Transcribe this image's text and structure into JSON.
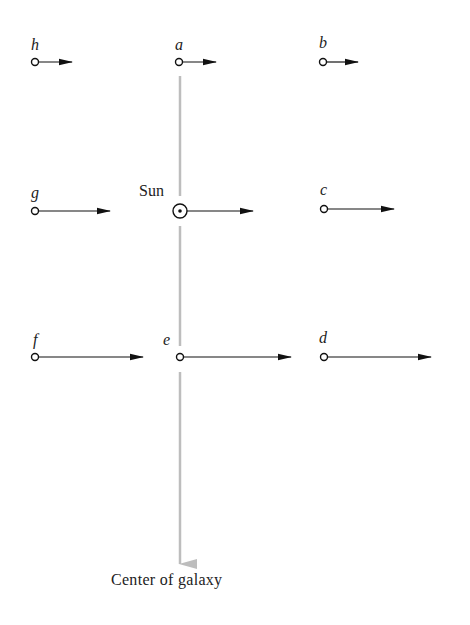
{
  "diagram": {
    "sun_label": "Sun",
    "center_label": "Center of galaxy",
    "colors": {
      "ink": "#111111",
      "axis": "#bdbdbd",
      "background": "#ffffff"
    },
    "stars": [
      {
        "id": "h",
        "label": "h",
        "x": 35,
        "y": 62,
        "arrow_end": 72
      },
      {
        "id": "a",
        "label": "a",
        "x": 179,
        "y": 62,
        "arrow_end": 216
      },
      {
        "id": "b",
        "label": "b",
        "x": 323,
        "y": 62,
        "arrow_end": 358
      },
      {
        "id": "g",
        "label": "g",
        "x": 35,
        "y": 211,
        "arrow_end": 110
      },
      {
        "id": "sun",
        "label": "Sun",
        "x": 180,
        "y": 211,
        "arrow_end": 253
      },
      {
        "id": "c",
        "label": "c",
        "x": 324,
        "y": 209,
        "arrow_end": 394
      },
      {
        "id": "f",
        "label": "f",
        "x": 35,
        "y": 357,
        "arrow_end": 143
      },
      {
        "id": "e",
        "label": "e",
        "x": 180,
        "y": 357,
        "arrow_end": 291
      },
      {
        "id": "d",
        "label": "d",
        "x": 324,
        "y": 357,
        "arrow_end": 431
      }
    ],
    "labels": {
      "h": "h",
      "a": "a",
      "b": "b",
      "g": "g",
      "c": "c",
      "f": "f",
      "e": "e",
      "d": "d"
    }
  }
}
